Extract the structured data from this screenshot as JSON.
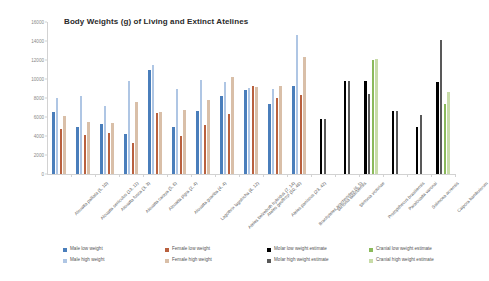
{
  "chart_data": {
    "type": "bar",
    "title": "Body Weights (g) of Living and Extinct Atelines",
    "xlabel": "",
    "ylabel": "",
    "ylim": [
      0,
      16000
    ],
    "yticks": [
      0,
      2000,
      4000,
      6000,
      8000,
      10000,
      12000,
      14000,
      16000
    ],
    "grid": false,
    "legend_position": "bottom",
    "categories": [
      "Alouatta palliata (5, 10)",
      "Alouatta seniculus (13, 11)",
      "Alouatta fusca (3, 3)",
      "Alouatta caraya (5, 6)",
      "Alouatta pigra (2, 4)",
      "Alouatta guariba (4, 4)",
      "Lagothrix lagotricha (6, 12)",
      "Ateles belzebuth hybridus (7, 14)",
      "Ateles geoffroyi (50, 46)",
      "Ateles paniscus (23, 42)",
      "Brachyteles arachnoides (6, 5)",
      "Stirtonia tatacoensis",
      "Stirtonia victoriae",
      "Protopithecus brasiliensis",
      "Paralouatta varonai",
      "Solimoea acrensis",
      "Caipora bambuiorum"
    ],
    "series": [
      {
        "name": "Male low weight",
        "color": "#4A7EBB",
        "values": [
          6500,
          5000,
          5300,
          4200,
          10900,
          4900,
          6600,
          8200,
          8800,
          7400,
          9300,
          null,
          null,
          null,
          null,
          null,
          null
        ]
      },
      {
        "name": "Male high weight",
        "color": "#AFC6E4",
        "values": [
          7950,
          8250,
          7150,
          9800,
          11500,
          8950,
          9900,
          9700,
          9100,
          8900,
          14650,
          null,
          null,
          null,
          null,
          null,
          null
        ]
      },
      {
        "name": "Female low weight",
        "color": "#B9603E",
        "values": [
          4700,
          4100,
          4300,
          3300,
          6450,
          4000,
          5200,
          6350,
          9250,
          7950,
          8350,
          null,
          null,
          null,
          null,
          null,
          null
        ]
      },
      {
        "name": "Female high weight",
        "color": "#D9BFA8",
        "values": [
          6150,
          5500,
          5350,
          7550,
          6500,
          6700,
          7800,
          10250,
          9150,
          9300,
          12300,
          null,
          null,
          null,
          null,
          null,
          null
        ]
      },
      {
        "name": "Molar low weight estimate",
        "color": "#000000",
        "values": [
          null,
          null,
          null,
          null,
          null,
          null,
          null,
          null,
          null,
          null,
          null,
          5750,
          9800,
          9800,
          6650,
          4900,
          9700
        ]
      },
      {
        "name": "Molar high weight estimate",
        "color": "#595959",
        "values": [
          null,
          null,
          null,
          null,
          null,
          null,
          null,
          null,
          null,
          null,
          null,
          5750,
          9800,
          8450,
          6650,
          6200,
          14100
        ]
      },
      {
        "name": "Cranial low weight estimate",
        "color": "#8BBA5B",
        "values": [
          null,
          null,
          null,
          null,
          null,
          null,
          null,
          null,
          null,
          null,
          null,
          null,
          null,
          11950,
          null,
          null,
          7350
        ]
      },
      {
        "name": "Cranial high weight estimate",
        "color": "#C8DCA8",
        "values": [
          null,
          null,
          null,
          null,
          null,
          null,
          null,
          null,
          null,
          null,
          null,
          null,
          null,
          12100,
          null,
          null,
          8600
        ]
      }
    ],
    "legend": [
      {
        "label": "Male low weight",
        "color": "#4A7EBB"
      },
      {
        "label": "Male high weight",
        "color": "#AFC6E4"
      },
      {
        "label": "Female low weight",
        "color": "#B9603E"
      },
      {
        "label": "Female high weight",
        "color": "#D9BFA8"
      },
      {
        "label": "Molar low weight estimate",
        "color": "#000000"
      },
      {
        "label": "Molar high weight estimate",
        "color": "#595959"
      },
      {
        "label": "Cranial low weight estimate",
        "color": "#8BBA5B"
      },
      {
        "label": "Cranial high weight estimate",
        "color": "#C8DCA8"
      }
    ]
  }
}
